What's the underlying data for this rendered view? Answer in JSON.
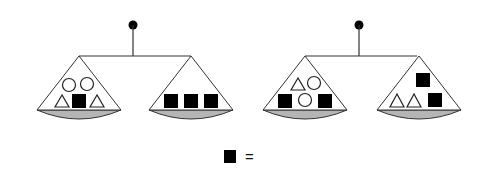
{
  "puzzle": {
    "type": "balance-scale-puzzle",
    "scales": [
      {
        "id": "scale-1",
        "left_pan": [
          "circle",
          "circle",
          "triangle",
          "square",
          "triangle"
        ],
        "right_pan": [
          "square",
          "square",
          "square"
        ]
      },
      {
        "id": "scale-2",
        "left_pan": [
          "triangle",
          "circle",
          "square",
          "circle",
          "square"
        ],
        "right_pan": [
          "square",
          "triangle",
          "triangle",
          "square"
        ]
      }
    ],
    "question": {
      "symbol": "square",
      "operator": "="
    }
  },
  "colors": {
    "line": "#333333",
    "bowl": "#b5b5b5",
    "filled_shape": "#000000",
    "open_shape": "#ffffff"
  }
}
